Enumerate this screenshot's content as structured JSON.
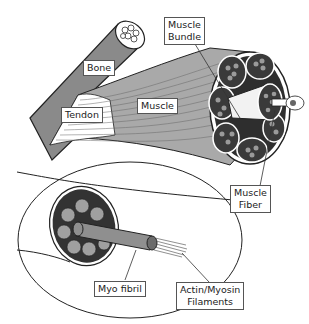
{
  "diagram": {
    "labels": {
      "bone": "Bone",
      "tendon": "Tendon",
      "muscle": "Muscle",
      "muscle_bundle_line1": "Muscle",
      "muscle_bundle_line2": "Bundle",
      "muscle_fiber_line1": "Muscle",
      "muscle_fiber_line2": "Fiber",
      "myofibril": "Myo fibril",
      "filaments_line1": "Actin/Myosin",
      "filaments_line2": "Filaments"
    },
    "colors": {
      "bone": "#8a8a8a",
      "muscle": "#a9a9a9",
      "bundle_dark": "#3a3a3a",
      "cell_gray": "#9a9a9a",
      "outline": "#222222"
    }
  }
}
